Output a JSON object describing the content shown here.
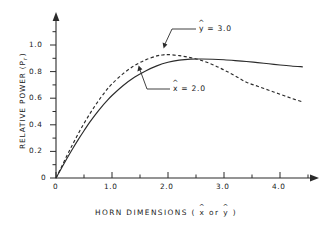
{
  "figure": {
    "background_color": "#ffffff",
    "ink_color": "#2b2b2b"
  },
  "axes": {
    "x_title_prefix": "HORN  DIMENSIONS  (",
    "x_title_var1": "x",
    "x_title_middle": "or",
    "x_title_var2": "y",
    "x_title_suffix": ")",
    "y_title_prefix": "RELATIVE  POWER  (",
    "y_title_var": "P",
    "y_title_sub": "r",
    "y_title_suffix": ")",
    "x_ticks": [
      "0",
      "1.0",
      "2.0",
      "3.0",
      "4.0"
    ],
    "y_ticks": [
      "0",
      "0.2",
      "0.4",
      "0.6",
      "0.8",
      "1.0"
    ]
  },
  "annotations": {
    "dashed": {
      "var": "y",
      "text": "= 3.0",
      "full": "ŷ = 3.0"
    },
    "solid": {
      "var": "x",
      "text": "= 2.0",
      "full": "x̂ = 2.0"
    }
  },
  "chart_data": {
    "type": "line",
    "title": "",
    "xlabel": "HORN DIMENSIONS ( x̂ or ŷ )",
    "ylabel": "RELATIVE POWER ( P_r )",
    "xlim": [
      0,
      4.75
    ],
    "ylim": [
      0,
      1.15
    ],
    "grid": false,
    "legend": "annotated-inline",
    "x_ticks_major": [
      0,
      1.0,
      2.0,
      3.0,
      4.0
    ],
    "x_ticks_minor": [
      0.5,
      1.5,
      2.5,
      3.5,
      4.5
    ],
    "y_ticks_major": [
      0,
      0.2,
      0.4,
      0.6,
      0.8,
      1.0
    ],
    "series": [
      {
        "name": "x̂ = 2.0",
        "style": "solid",
        "label": "x̂ = 2.0",
        "x": [
          0,
          0.1,
          0.2,
          0.3,
          0.4,
          0.5,
          0.6,
          0.7,
          0.8,
          0.9,
          1.0,
          1.2,
          1.4,
          1.6,
          1.8,
          2.0,
          2.2,
          2.4,
          2.6,
          2.8,
          3.0,
          3.2,
          3.4,
          3.6,
          3.8,
          4.0,
          4.2,
          4.4
        ],
        "y": [
          0.0,
          0.075,
          0.15,
          0.222,
          0.29,
          0.355,
          0.418,
          0.475,
          0.528,
          0.576,
          0.62,
          0.695,
          0.757,
          0.805,
          0.843,
          0.87,
          0.886,
          0.894,
          0.895,
          0.893,
          0.889,
          0.883,
          0.876,
          0.868,
          0.859,
          0.85,
          0.842,
          0.836
        ]
      },
      {
        "name": "ŷ = 3.0",
        "style": "dashed",
        "label": "ŷ = 3.0",
        "x": [
          0,
          0.1,
          0.2,
          0.3,
          0.4,
          0.5,
          0.6,
          0.7,
          0.8,
          0.9,
          1.0,
          1.2,
          1.4,
          1.6,
          1.8,
          1.9,
          2.0,
          2.2,
          2.4,
          2.6,
          2.8,
          3.0,
          3.2,
          3.4,
          3.6,
          3.8,
          4.0,
          4.2,
          4.4
        ],
        "y": [
          0.0,
          0.085,
          0.172,
          0.255,
          0.335,
          0.41,
          0.48,
          0.545,
          0.605,
          0.66,
          0.708,
          0.785,
          0.845,
          0.888,
          0.918,
          0.925,
          0.928,
          0.92,
          0.905,
          0.884,
          0.852,
          0.812,
          0.768,
          0.72,
          0.69,
          0.66,
          0.63,
          0.6,
          0.572
        ]
      }
    ],
    "crossing_point": {
      "x": 2.6,
      "y": 0.89
    }
  }
}
